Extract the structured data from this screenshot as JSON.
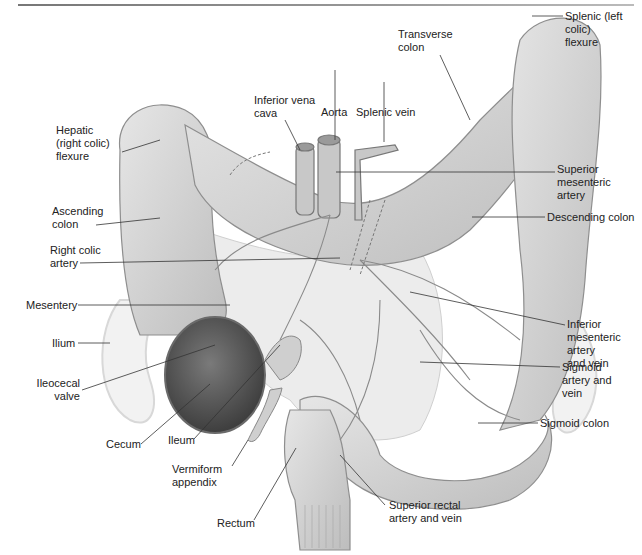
{
  "figure": {
    "labels": {
      "splenic_flexure": "Splenic (left colic)\nflexure",
      "transverse_colon": "Transverse\ncolon",
      "inferior_vena_cava": "Inferior vena\ncava",
      "aorta": "Aorta",
      "splenic_vein": "Splenic vein",
      "hepatic_flexure": "Hepatic\n(right colic)\nflexure",
      "superior_mesenteric_artery": "Superior\nmesenteric\nartery",
      "ascending_colon": "Ascending\ncolon",
      "descending_colon": "Descending colon",
      "right_colic_artery": "Right colic\nartery",
      "mesentery": "Mesentery",
      "inferior_mesenteric": "Inferior\nmesenteric\nartery\nand vein",
      "ilium": "Ilium",
      "ileocecal_valve": "Ileocecal\nvalve",
      "sigmoid_artery": "Sigmoid\nartery and\nvein",
      "sigmoid_colon": "Sigmoid colon",
      "cecum": "Cecum",
      "ileum": "Ileum",
      "vermiform_appendix": "Vermiform\nappendix",
      "rectum": "Rectum",
      "superior_rectal": "Superior rectal\nartery and vein"
    },
    "colors": {
      "tissue": "#d6d6d6",
      "tissue_dark": "#9a9a9a",
      "vessel": "#8a8a8a",
      "cecum_interior": "#555555",
      "leader_line": "#333333"
    }
  }
}
